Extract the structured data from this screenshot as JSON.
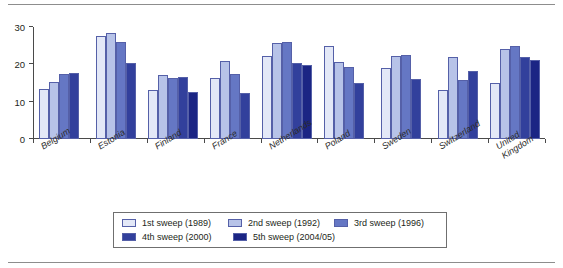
{
  "chart_data": {
    "type": "bar",
    "title": "",
    "subtitle": "",
    "xlabel": "",
    "ylabel": "",
    "ylim": [
      0,
      30
    ],
    "yticks": [
      0,
      10,
      20,
      30
    ],
    "grid": false,
    "legend_position": "bottom",
    "categories": [
      "Belgium",
      "Estonia",
      "Finland",
      "France",
      "Netherlands",
      "Poland",
      "Sweden",
      "Switzerland",
      "United Kingdom"
    ],
    "series": [
      {
        "name": "1st sweep (1989)",
        "color": "#e3e8f7",
        "values": [
          13.5,
          27.7,
          13.0,
          16.4,
          22.2,
          24.8,
          18.9,
          13.1,
          15.0
        ]
      },
      {
        "name": "2nd sweep (1992)",
        "color": "#b7c3e8",
        "values": [
          15.2,
          28.3,
          17.2,
          21.0,
          25.8,
          20.6,
          22.2,
          21.9,
          24.1
        ]
      },
      {
        "name": "3rd sweep (1996)",
        "color": "#6577c4",
        "values": [
          17.5,
          26.0,
          16.3,
          17.3,
          26.1,
          19.3,
          22.6,
          15.8,
          25.0
        ]
      },
      {
        "name": "4th sweep (2000)",
        "color": "#32409c",
        "values": [
          17.7,
          20.3,
          16.6,
          12.2,
          20.3,
          15.0,
          16.1,
          18.3,
          22.1
        ]
      },
      {
        "name": "5th sweep (2004/05)",
        "color": "#1b2584",
        "values": [
          null,
          null,
          12.7,
          null,
          19.9,
          null,
          null,
          null,
          21.2
        ]
      }
    ]
  }
}
